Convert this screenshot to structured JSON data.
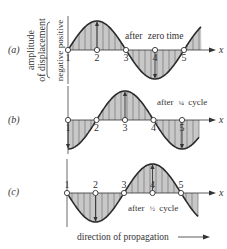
{
  "diagram": {
    "type": "transverse-wave-snapshots",
    "axis_label": {
      "line1": "amplitude",
      "line2": "of displacement",
      "positive": "positive",
      "negative": "negative"
    },
    "x_axis_label": "x",
    "point_labels": [
      "1",
      "2",
      "3",
      "4",
      "5"
    ],
    "panels": [
      {
        "id": "a",
        "label": "(a)",
        "caption_prefix": "after",
        "caption_frac": "",
        "caption_suffix": "zero time",
        "phase_cycles": 0
      },
      {
        "id": "b",
        "label": "(b)",
        "caption_prefix": "after",
        "caption_frac": "¼",
        "caption_suffix": "cycle",
        "phase_cycles": 0.25
      },
      {
        "id": "c",
        "label": "(c)",
        "caption_prefix": "after",
        "caption_frac": "½",
        "caption_suffix": "cycle",
        "phase_cycles": 0.5
      }
    ],
    "footer": "direction of propagation",
    "colors": {
      "curve": "#2b2b2b",
      "fill": "#c8c8c8",
      "text": "#333333"
    }
  }
}
